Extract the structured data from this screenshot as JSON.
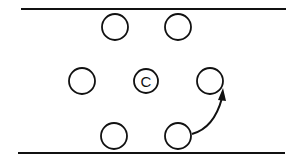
{
  "diagram": {
    "lines": [
      {
        "name": "top-boundary",
        "x1": 21,
        "y1": 9,
        "x2": 286,
        "y2": 9
      },
      {
        "name": "bottom-boundary",
        "x1": 18,
        "y1": 153,
        "x2": 285,
        "y2": 153
      }
    ],
    "circles": [
      {
        "name": "circle-top-left",
        "cx": 115,
        "cy": 27,
        "r": 13,
        "label": ""
      },
      {
        "name": "circle-top-right",
        "cx": 178,
        "cy": 27,
        "r": 13,
        "label": ""
      },
      {
        "name": "circle-middle-left",
        "cx": 82,
        "cy": 81,
        "r": 13,
        "label": ""
      },
      {
        "name": "circle-center",
        "cx": 146,
        "cy": 81,
        "r": 12,
        "label": "C"
      },
      {
        "name": "circle-middle-right",
        "cx": 210,
        "cy": 81,
        "r": 13,
        "label": ""
      },
      {
        "name": "circle-bottom-left",
        "cx": 114,
        "cy": 136,
        "r": 13,
        "label": ""
      },
      {
        "name": "circle-bottom-right",
        "cx": 178,
        "cy": 136,
        "r": 13,
        "label": ""
      }
    ],
    "arrow": {
      "from": "circle-bottom-right",
      "to": "circle-middle-right"
    },
    "colors": {
      "stroke": "#111111",
      "background": "#ffffff"
    }
  }
}
